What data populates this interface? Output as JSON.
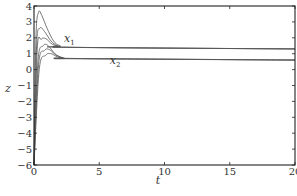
{
  "chart_data": {
    "type": "line",
    "title": "",
    "xlabel": "t",
    "ylabel": "z",
    "xlim": [
      0,
      20
    ],
    "ylim": [
      -6,
      4
    ],
    "xticks": [
      "0",
      "5",
      "10",
      "15",
      "20"
    ],
    "yticks": [
      "4",
      "3",
      "2",
      "1",
      "0",
      "−1",
      "−2",
      "−3",
      "−4",
      "−5",
      "−6"
    ],
    "grid": false,
    "legend": null,
    "annotations": [
      {
        "text": "x1",
        "display": "x",
        "sub": "1",
        "x": 2.3,
        "y": 1.75
      },
      {
        "text": "x2",
        "display": "x",
        "sub": "2",
        "x": 5.8,
        "y": 0.35
      }
    ],
    "series": [
      {
        "name": "x1 (ic a)",
        "group": "x1",
        "points": [
          [
            0,
            -6
          ],
          [
            0.15,
            2.0
          ],
          [
            0.35,
            3.6
          ],
          [
            0.6,
            3.4
          ],
          [
            1.0,
            2.6
          ],
          [
            1.5,
            1.8
          ],
          [
            2.0,
            1.5
          ],
          [
            3,
            1.4
          ],
          [
            20,
            1.3
          ]
        ]
      },
      {
        "name": "x1 (ic b)",
        "group": "x1",
        "points": [
          [
            0,
            -6
          ],
          [
            0.2,
            1.5
          ],
          [
            0.45,
            2.6
          ],
          [
            0.8,
            2.4
          ],
          [
            1.3,
            1.8
          ],
          [
            1.8,
            1.5
          ],
          [
            2.5,
            1.4
          ],
          [
            20,
            1.3
          ]
        ]
      },
      {
        "name": "x1 (ic c)",
        "group": "x1",
        "points": [
          [
            0,
            -6
          ],
          [
            0.25,
            1.3
          ],
          [
            0.55,
            1.9
          ],
          [
            0.9,
            1.95
          ],
          [
            1.4,
            1.6
          ],
          [
            2.0,
            1.45
          ],
          [
            3,
            1.4
          ],
          [
            20,
            1.3
          ]
        ]
      },
      {
        "name": "x2 (ic a)",
        "group": "x2",
        "points": [
          [
            0,
            -6
          ],
          [
            0.3,
            0.5
          ],
          [
            0.7,
            1.5
          ],
          [
            1.1,
            1.5
          ],
          [
            1.6,
            1.0
          ],
          [
            2.2,
            0.75
          ],
          [
            3,
            0.7
          ],
          [
            20,
            0.6
          ]
        ]
      },
      {
        "name": "x2 (ic b)",
        "group": "x2",
        "points": [
          [
            0,
            -6
          ],
          [
            0.35,
            0.3
          ],
          [
            0.8,
            1.2
          ],
          [
            1.2,
            1.25
          ],
          [
            1.7,
            0.9
          ],
          [
            2.3,
            0.72
          ],
          [
            3,
            0.7
          ],
          [
            20,
            0.6
          ]
        ]
      },
      {
        "name": "x2 (ic c)",
        "group": "x2",
        "points": [
          [
            0,
            -6
          ],
          [
            0.4,
            0.0
          ],
          [
            0.9,
            0.9
          ],
          [
            1.3,
            1.0
          ],
          [
            1.8,
            0.8
          ],
          [
            2.4,
            0.7
          ],
          [
            3,
            0.68
          ],
          [
            20,
            0.6
          ]
        ]
      }
    ]
  }
}
